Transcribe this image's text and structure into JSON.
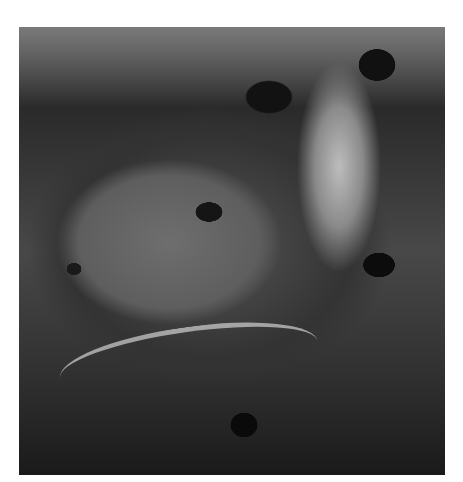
{
  "image": {
    "subject": "lunar crater",
    "description": "Oblique grayscale view of a large lunar impact crater with a flat mare-like floor, central peak, bright sunlit terraced rim, and surrounding cratered highlands",
    "colors": {
      "background": "#ffffff",
      "crater_floor": "#5e5e5e",
      "shadow": "#0c0c0c",
      "bright_rim": "#bdbdbd"
    }
  }
}
